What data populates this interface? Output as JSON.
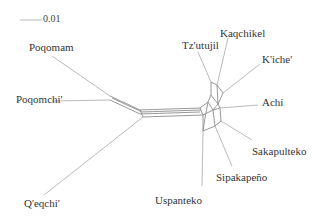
{
  "diagram": {
    "type": "split-network",
    "scale_bar": {
      "label": "0.01",
      "x1": 20,
      "x2": 42,
      "y": 20
    },
    "taxa": [
      {
        "id": "poqomam",
        "label": "Poqomam",
        "lx": 29,
        "ly": 42,
        "tip": [
          52,
          56
        ],
        "hub": [
          110,
          96
        ]
      },
      {
        "id": "poqomchi",
        "label": "Poqomchi'",
        "lx": 16,
        "ly": 94,
        "tip": [
          52,
          101
        ],
        "hub": [
          110,
          100
        ]
      },
      {
        "id": "qeqchi",
        "label": "Q'eqchi'",
        "lx": 24,
        "ly": 198,
        "tip": [
          44,
          195
        ],
        "hub": [
          143,
          117
        ]
      },
      {
        "id": "uspanteko",
        "label": "Uspanteko",
        "lx": 155,
        "ly": 195,
        "tip": [
          202,
          186
        ],
        "hub": [
          203,
          131
        ]
      },
      {
        "id": "sipakapeno",
        "label": "Sipakapeño",
        "lx": 216,
        "ly": 172,
        "tip": [
          232,
          166
        ],
        "hub": [
          215,
          126
        ]
      },
      {
        "id": "sakapulteko",
        "label": "Sakapulteko",
        "lx": 252,
        "ly": 146,
        "tip": [
          252,
          140
        ],
        "hub": [
          221,
          121
        ]
      },
      {
        "id": "achi",
        "label": "Achí",
        "lx": 262,
        "ly": 97,
        "tip": [
          258,
          105
        ],
        "hub": [
          220,
          108
        ]
      },
      {
        "id": "kiche",
        "label": "K'iche'",
        "lx": 262,
        "ly": 54,
        "tip": [
          260,
          64
        ],
        "hub": [
          223,
          93
        ]
      },
      {
        "id": "kaqchikel",
        "label": "Kaqchikel",
        "lx": 220,
        "ly": 28,
        "tip": [
          228,
          38
        ],
        "hub": [
          217,
          85
        ]
      },
      {
        "id": "tzutujil",
        "label": "Tz'utujil",
        "lx": 182,
        "ly": 40,
        "tip": [
          198,
          52
        ],
        "hub": [
          211,
          82
        ]
      }
    ],
    "splits": [
      [
        [
          110,
          96
        ],
        [
          140,
          110
        ]
      ],
      [
        [
          110,
          100
        ],
        [
          140,
          114
        ]
      ],
      [
        [
          112,
          98
        ],
        [
          142,
          112
        ]
      ],
      [
        [
          140,
          110
        ],
        [
          200,
          108
        ]
      ],
      [
        [
          140,
          114
        ],
        [
          200,
          112
        ]
      ],
      [
        [
          142,
          112
        ],
        [
          201,
          110
        ]
      ],
      [
        [
          143,
          117
        ],
        [
          203,
          115
        ]
      ],
      [
        [
          140,
          110
        ],
        [
          143,
          117
        ]
      ],
      [
        [
          200,
          108
        ],
        [
          203,
          115
        ]
      ],
      [
        [
          200,
          108
        ],
        [
          208,
          102
        ]
      ],
      [
        [
          203,
          115
        ],
        [
          213,
          110
        ]
      ],
      [
        [
          208,
          102
        ],
        [
          213,
          110
        ]
      ],
      [
        [
          208,
          102
        ],
        [
          211,
          95
        ]
      ],
      [
        [
          213,
          110
        ],
        [
          218,
          104
        ]
      ],
      [
        [
          211,
          95
        ],
        [
          218,
          104
        ]
      ],
      [
        [
          211,
          95
        ],
        [
          211,
          82
        ]
      ],
      [
        [
          218,
          104
        ],
        [
          217,
          85
        ]
      ],
      [
        [
          211,
          82
        ],
        [
          217,
          85
        ]
      ],
      [
        [
          217,
          85
        ],
        [
          223,
          93
        ]
      ],
      [
        [
          218,
          104
        ],
        [
          223,
          93
        ]
      ],
      [
        [
          213,
          110
        ],
        [
          220,
          108
        ]
      ],
      [
        [
          218,
          104
        ],
        [
          220,
          108
        ]
      ],
      [
        [
          203,
          115
        ],
        [
          203,
          131
        ]
      ],
      [
        [
          213,
          110
        ],
        [
          215,
          126
        ]
      ],
      [
        [
          203,
          131
        ],
        [
          215,
          126
        ]
      ],
      [
        [
          215,
          126
        ],
        [
          221,
          121
        ]
      ],
      [
        [
          220,
          108
        ],
        [
          221,
          121
        ]
      ],
      [
        [
          208,
          102
        ],
        [
          205,
          118
        ]
      ],
      [
        [
          205,
          118
        ],
        [
          203,
          131
        ]
      ]
    ]
  }
}
